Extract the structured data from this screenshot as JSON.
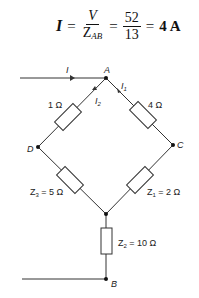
{
  "equation": {
    "lhs": "I",
    "eq1": "=",
    "frac1_num": "V",
    "frac1_den_main": "Z",
    "frac1_den_sub": "AB",
    "eq2": "=",
    "frac2_num": "52",
    "frac2_den": "13",
    "eq3": "=",
    "result": "4 A"
  },
  "circuit": {
    "nodes": {
      "A": "A",
      "B": "B",
      "C": "C",
      "D": "D"
    },
    "currents": {
      "I": "I",
      "I1": "I",
      "I1_sub": "1",
      "I2": "I",
      "I2_sub": "2"
    },
    "resistors": {
      "r_AD": "1 Ω",
      "r_AC": "4 Ω",
      "z3_main": "Z",
      "z3_sub": "3",
      "z3_val": " = 5 Ω",
      "z1_main": "Z",
      "z1_sub": "1",
      "z1_val": " = 2 Ω",
      "z2_main": "Z",
      "z2_sub": "2",
      "z2_val": " = 10 Ω"
    },
    "colors": {
      "wire": "#333333",
      "text": "#222222"
    }
  }
}
